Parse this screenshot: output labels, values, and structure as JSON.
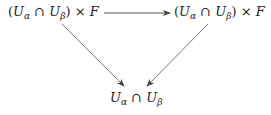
{
  "diagram": {
    "type": "commutative-diagram",
    "nodes": {
      "top_left": {
        "open": "(",
        "u1": "U",
        "sub1": "α",
        "cap": " ∩ ",
        "u2": "U",
        "sub2": "β",
        "close": ")",
        "times": " × ",
        "f": "F"
      },
      "top_right": {
        "open": "(",
        "u1": "U",
        "sub1": "α",
        "cap": " ∩ ",
        "u2": "U",
        "sub2": "β",
        "close": ")",
        "times": " × ",
        "f": "F"
      },
      "bottom": {
        "u1": "U",
        "sub1": "α",
        "cap": " ∩ ",
        "u2": "U",
        "sub2": "β"
      }
    },
    "arrows": [
      {
        "from": "top_left",
        "to": "top_right",
        "label": ""
      },
      {
        "from": "top_left",
        "to": "bottom",
        "label": ""
      },
      {
        "from": "top_right",
        "to": "bottom",
        "label": ""
      }
    ],
    "colors": {
      "text": "#222222",
      "arrow": "#444444"
    }
  }
}
